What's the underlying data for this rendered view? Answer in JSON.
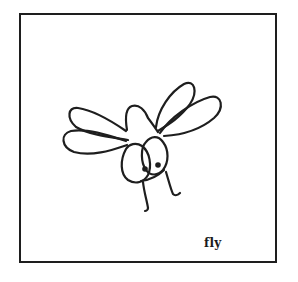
{
  "card": {
    "label": "fly",
    "illustration": "fly-icon",
    "stroke_color": "#1e1e1e",
    "background_color": "#ffffff"
  }
}
